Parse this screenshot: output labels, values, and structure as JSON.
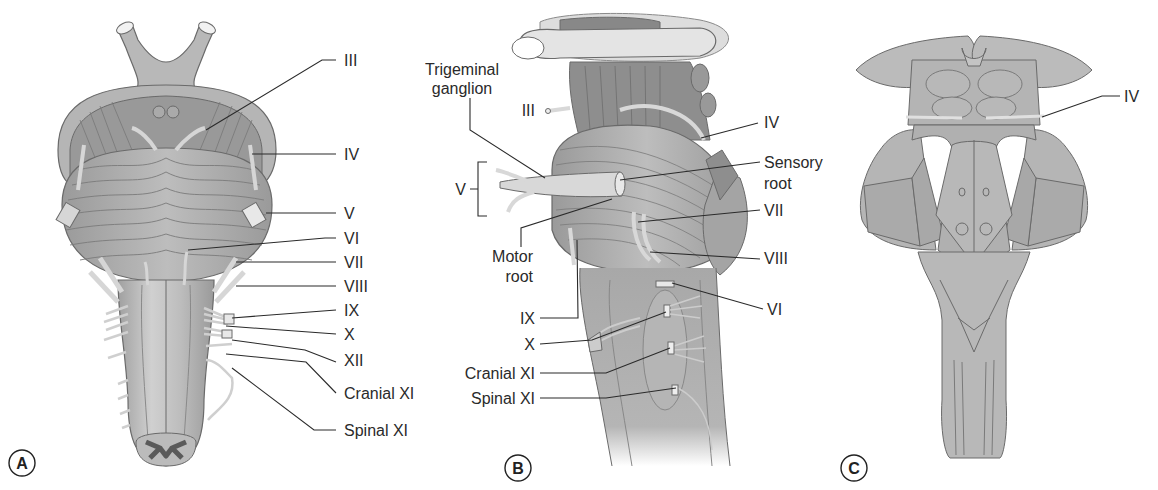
{
  "figure": {
    "colors": {
      "tissue": "#a9a9a9",
      "tissue_dark": "#8a8a8a",
      "tissue_light": "#c8c8c8",
      "outline": "#6a6a6a",
      "nerve": "#d9d9d9",
      "text": "#2a2a2a"
    }
  },
  "panels": [
    {
      "id": "A",
      "view": "anterior",
      "letter": "A",
      "labels": [
        "III",
        "IV",
        "V",
        "VI",
        "VII",
        "VIII",
        "IX",
        "X",
        "XII",
        "Cranial XI",
        "Spinal XI"
      ]
    },
    {
      "id": "B",
      "view": "lateral",
      "letter": "B",
      "labels_left": [
        "Trigeminal",
        "ganglion",
        "III",
        "V",
        "Motor",
        "root",
        "IX",
        "X",
        "Cranial XI",
        "Spinal XI"
      ],
      "labels_right": [
        "IV",
        "Sensory",
        "root",
        "VII",
        "VIII",
        "VI"
      ]
    },
    {
      "id": "C",
      "view": "posterior",
      "letter": "C",
      "labels": [
        "IV"
      ]
    }
  ]
}
